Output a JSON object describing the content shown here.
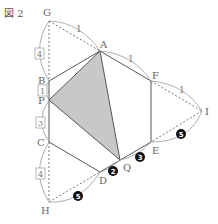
{
  "figure": {
    "title": "図 2",
    "vertices": {
      "G": {
        "label": "G",
        "x": 49,
        "y": 21
      },
      "A": {
        "label": "A",
        "x": 100,
        "y": 51
      },
      "F": {
        "label": "F",
        "x": 151,
        "y": 81
      },
      "I": {
        "label": "I",
        "x": 202,
        "y": 111
      },
      "E": {
        "label": "E",
        "x": 151,
        "y": 142
      },
      "Q": {
        "label": "Q",
        "x": 120,
        "y": 160
      },
      "D": {
        "label": "D",
        "x": 100,
        "y": 172
      },
      "H": {
        "label": "H",
        "x": 49,
        "y": 202
      },
      "C": {
        "label": "C",
        "x": 49,
        "y": 142
      },
      "P": {
        "label": "P",
        "x": 49,
        "y": 100
      },
      "B": {
        "label": "B",
        "x": 49,
        "y": 81
      }
    },
    "length_labels": {
      "GA": "1",
      "AF": "1",
      "FI": "1",
      "GB": "4",
      "BP": "1",
      "PC": "3",
      "CH": "4",
      "DQ": "2",
      "QE": "3",
      "EI": "5",
      "HD": "5"
    },
    "shaded_triangle": [
      "A",
      "P",
      "Q"
    ],
    "hexagon": [
      "A",
      "F",
      "E",
      "D",
      "C",
      "B"
    ],
    "colors": {
      "line": "#555555",
      "shade": "#c8c8c8",
      "arc": "#999999",
      "badge": "#111111"
    }
  }
}
